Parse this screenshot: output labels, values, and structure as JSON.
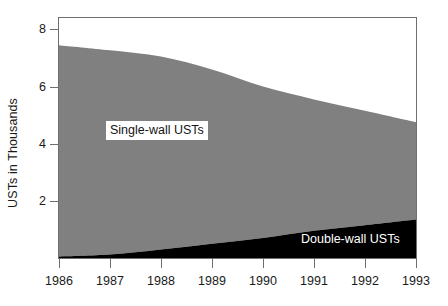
{
  "chart_data": {
    "type": "area",
    "title": "",
    "subtitle": "",
    "xlabel": "",
    "ylabel": "USTs in Thousands",
    "stacked": true,
    "grid": false,
    "legend_position": "inline-annotations",
    "x": [
      1986,
      1987,
      1988,
      1989,
      1990,
      1991,
      1992,
      1993
    ],
    "categories": [
      "1986",
      "1987",
      "1988",
      "1989",
      "1990",
      "1991",
      "1992",
      "1993"
    ],
    "xlim": [
      1986,
      1993
    ],
    "ylim": [
      0,
      8.4
    ],
    "yticks": [
      2,
      4,
      6,
      8
    ],
    "ytick_labels": [
      "2",
      "4",
      "6",
      "8"
    ],
    "xticks": [
      1986,
      1987,
      1988,
      1989,
      1990,
      1991,
      1992,
      1993
    ],
    "series": [
      {
        "name": "Single-wall USTs",
        "color": "#808080",
        "values": [
          7.4,
          7.15,
          6.75,
          6.1,
          5.3,
          4.6,
          4.0,
          3.4
        ]
      },
      {
        "name": "Double-wall USTs",
        "color": "#000000",
        "values": [
          0.05,
          0.12,
          0.3,
          0.5,
          0.7,
          0.95,
          1.15,
          1.35
        ]
      }
    ],
    "annotations": [
      {
        "text": "Single-wall USTs",
        "target": "single-wall-area",
        "style": "dark-on-white-box"
      },
      {
        "text": "Double-wall USTs",
        "target": "double-wall-area",
        "style": "white-on-black"
      }
    ]
  },
  "axes": {
    "y_title": "USTs in Thousands",
    "y_ticks": [
      {
        "label": "8",
        "value": 8
      },
      {
        "label": "6",
        "value": 6
      },
      {
        "label": "4",
        "value": 4
      },
      {
        "label": "2",
        "value": 2
      }
    ],
    "x_ticks": [
      {
        "label": "1986",
        "value": 1986
      },
      {
        "label": "1987",
        "value": 1987
      },
      {
        "label": "1988",
        "value": 1988
      },
      {
        "label": "1989",
        "value": 1989
      },
      {
        "label": "1990",
        "value": 1990
      },
      {
        "label": "1991",
        "value": 1991
      },
      {
        "label": "1992",
        "value": 1992
      },
      {
        "label": "1993",
        "value": 1993
      }
    ]
  },
  "legend": {
    "single_wall": "Single-wall USTs",
    "double_wall": "Double-wall USTs"
  },
  "colors": {
    "single_wall": "#808080",
    "double_wall": "#000000",
    "axis": "#6e6e6e",
    "text": "#1a1a1a",
    "background": "#ffffff"
  }
}
